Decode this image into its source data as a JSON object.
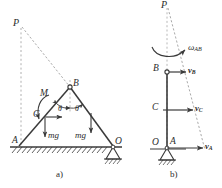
{
  "figure": {
    "type": "mechanics-diagram",
    "panels": [
      {
        "id": "a",
        "caption": "a)",
        "description": "Free body diagram of two-bar mechanism AB and BO on rough ground",
        "labels": {
          "p": "P",
          "b": "B",
          "c": "C",
          "a": "A",
          "o": "O",
          "moment": "M",
          "theta_left": "θ",
          "theta_right": "θ",
          "weight_left": "mg",
          "weight_right": "mg"
        }
      },
      {
        "id": "b",
        "caption": "b)",
        "description": "Velocity diagram showing velocity distribution along bar with instantaneous centre P",
        "labels": {
          "p": "P",
          "b": "B",
          "c": "C",
          "o": "O",
          "a": "A",
          "omega_main": "ω",
          "omega_sub": "AB",
          "vb_main": "v",
          "vb_sub": "B",
          "vc_main": "v",
          "vc_sub": "C",
          "va_main": "v",
          "va_sub": "A"
        }
      }
    ]
  },
  "colors": {
    "ink": "#2b2b2b",
    "solid_line": "#3a3a3a",
    "dashed_line": "#9a9a9a",
    "background": "#ffffff"
  }
}
